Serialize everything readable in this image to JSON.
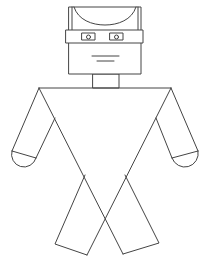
{
  "figure": {
    "width": 208,
    "height": 260,
    "colors": {
      "stroke": "#444444",
      "background": "#ffffff"
    },
    "parts": {
      "head": {
        "x": 69,
        "y": 7,
        "w": 72,
        "h": 67
      },
      "hair": {
        "left_x": 72,
        "right_x": 138,
        "arc_bottom_y": 25
      },
      "visor_band": {
        "x": 66,
        "y": 30,
        "w": 77,
        "h": 13
      },
      "left_eye": {
        "x": 82,
        "y": 33,
        "w": 13,
        "h": 7,
        "pupil_cx": 88.5,
        "pupil_cy": 37.5,
        "pupil_r": 2
      },
      "right_eye": {
        "x": 110,
        "y": 33,
        "w": 13,
        "h": 7,
        "pupil_cx": 116.5,
        "pupil_cy": 37.5,
        "pupil_r": 2
      },
      "mouth": [
        {
          "x1": 92,
          "y1": 56,
          "x2": 119,
          "y2": 56
        },
        {
          "x1": 97,
          "y1": 61,
          "x2": 114,
          "y2": 61
        }
      ],
      "neck": {
        "x": 93,
        "y": 74,
        "w": 26,
        "h": 14
      },
      "shoulders": {
        "x1": 39,
        "y1": 88,
        "x2": 171,
        "y2": 88
      }
    }
  }
}
